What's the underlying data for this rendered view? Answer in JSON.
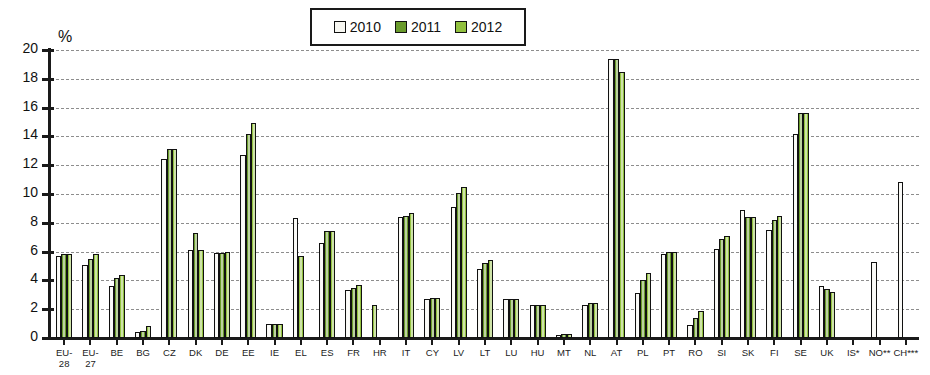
{
  "chart_data": {
    "type": "bar",
    "title": "",
    "xlabel": "",
    "ylabel": "%",
    "ylim": [
      0,
      20
    ],
    "ytick_step": 2,
    "yticks": [
      "0",
      "2",
      "4",
      "6",
      "8",
      "10",
      "12",
      "14",
      "16",
      "18",
      "20"
    ],
    "grid": true,
    "legend_position": "top-center",
    "colors": {
      "y2010": "#f7f7f2",
      "y2011": "#6a9b2c",
      "y2012": "#92c13f",
      "outline": "#111111",
      "axis": "#1a1a1a",
      "gridline": "#8d8d8d"
    },
    "categories": [
      "EU-28",
      "EU-27",
      "BE",
      "BG",
      "CZ",
      "DK",
      "DE",
      "EE",
      "IE",
      "EL",
      "ES",
      "FR",
      "HR",
      "IT",
      "CY",
      "LV",
      "LT",
      "LU",
      "HU",
      "MT",
      "NL",
      "AT",
      "PL",
      "PT",
      "RO",
      "SI",
      "SK",
      "FI",
      "SE",
      "UK",
      "IS*",
      "NO**",
      "CH***"
    ],
    "category_labels": [
      "EU-\n28",
      "EU-\n27",
      "BE",
      "BG",
      "CZ",
      "DK",
      "DE",
      "EE",
      "IE",
      "EL",
      "ES",
      "FR",
      "HR",
      "IT",
      "CY",
      "LV",
      "LT",
      "LU",
      "HU",
      "MT",
      "NL",
      "AT",
      "PL",
      "PT",
      "RO",
      "SI",
      "SK",
      "FI",
      "SE",
      "UK",
      "IS*",
      "NO**",
      "CH***"
    ],
    "series": [
      {
        "name": "2010",
        "key": "y2010",
        "values": [
          5.7,
          5.1,
          3.6,
          0.4,
          12.4,
          6.1,
          5.9,
          12.7,
          1.0,
          8.3,
          6.6,
          3.3,
          null,
          8.4,
          2.7,
          9.1,
          4.8,
          2.7,
          2.3,
          0.2,
          2.3,
          19.4,
          3.1,
          5.8,
          0.9,
          6.2,
          8.9,
          7.5,
          14.2,
          3.6,
          null,
          5.3,
          10.8
        ]
      },
      {
        "name": "2011",
        "key": "y2011",
        "values": [
          5.8,
          5.5,
          4.2,
          0.5,
          13.1,
          7.3,
          5.9,
          14.2,
          1.0,
          null,
          7.4,
          3.5,
          null,
          8.5,
          2.8,
          10.1,
          5.2,
          2.7,
          2.3,
          0.3,
          2.4,
          19.4,
          4.0,
          6.0,
          1.4,
          6.9,
          8.4,
          8.2,
          15.6,
          3.4,
          null,
          null,
          null
        ]
      },
      {
        "name": "2012",
        "key": "y2012",
        "values": [
          5.8,
          5.8,
          4.4,
          0.8,
          13.1,
          6.1,
          6.0,
          14.9,
          1.0,
          5.7,
          7.4,
          3.7,
          2.3,
          8.7,
          2.8,
          10.5,
          5.4,
          2.7,
          2.3,
          0.3,
          2.4,
          18.5,
          4.5,
          6.0,
          1.9,
          7.1,
          8.4,
          8.5,
          15.6,
          3.2,
          null,
          null,
          null
        ]
      }
    ]
  },
  "legend": {
    "items": [
      {
        "label": "2010",
        "key": "y2010"
      },
      {
        "label": "2011",
        "key": "y2011"
      },
      {
        "label": "2012",
        "key": "y2012"
      }
    ]
  },
  "axis": {
    "unit_label": "%"
  }
}
